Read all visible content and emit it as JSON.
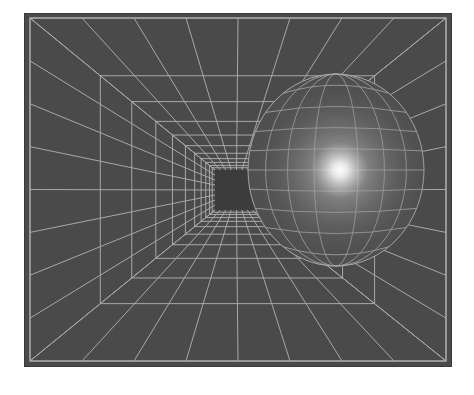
{
  "image": {
    "description": "Grayscale perspective wireframe tunnel with a glowing distorted sphere on the right",
    "colors": {
      "background": "#ffffff",
      "panel": "#4a4a4a",
      "grid_line": "#a8a8a8",
      "frame_line": "#b5b5b5",
      "center_square": "#3c3c3c",
      "highlight": "#ffffff"
    },
    "frame": {
      "x": 24,
      "y": 13,
      "width": 428,
      "height": 354
    },
    "vanishing_point": {
      "x": 236,
      "y": 190
    },
    "center_square": {
      "x": 215,
      "y": 170,
      "width": 43,
      "height": 40
    },
    "sphere": {
      "cx": 336,
      "cy": 170,
      "rx": 88,
      "ry": 96,
      "highlight_x": 340,
      "highlight_y": 170
    }
  }
}
